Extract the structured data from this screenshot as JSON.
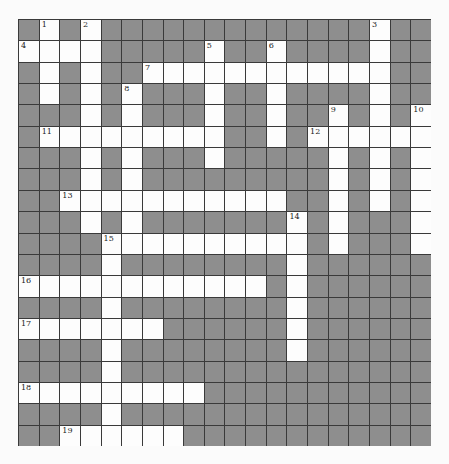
{
  "puzzle": {
    "rows": 20,
    "cols": 20,
    "colors": {
      "block": "#8e8e8e",
      "open": "#fdfdfd",
      "grid_line": "#3a3a3a",
      "number": "#222222"
    },
    "open_cells": [
      [
        0,
        1
      ],
      [
        0,
        3
      ],
      [
        0,
        17
      ],
      [
        1,
        0
      ],
      [
        1,
        1
      ],
      [
        1,
        2
      ],
      [
        1,
        3
      ],
      [
        1,
        9
      ],
      [
        1,
        12
      ],
      [
        1,
        17
      ],
      [
        2,
        1
      ],
      [
        2,
        3
      ],
      [
        2,
        6
      ],
      [
        2,
        7
      ],
      [
        2,
        8
      ],
      [
        2,
        9
      ],
      [
        2,
        10
      ],
      [
        2,
        11
      ],
      [
        2,
        12
      ],
      [
        2,
        13
      ],
      [
        2,
        14
      ],
      [
        2,
        15
      ],
      [
        2,
        16
      ],
      [
        2,
        17
      ],
      [
        3,
        1
      ],
      [
        3,
        3
      ],
      [
        3,
        5
      ],
      [
        3,
        9
      ],
      [
        3,
        12
      ],
      [
        3,
        17
      ],
      [
        4,
        3
      ],
      [
        4,
        5
      ],
      [
        4,
        9
      ],
      [
        4,
        12
      ],
      [
        4,
        15
      ],
      [
        4,
        17
      ],
      [
        4,
        19
      ],
      [
        5,
        1
      ],
      [
        5,
        2
      ],
      [
        5,
        3
      ],
      [
        5,
        4
      ],
      [
        5,
        5
      ],
      [
        5,
        6
      ],
      [
        5,
        7
      ],
      [
        5,
        8
      ],
      [
        5,
        9
      ],
      [
        5,
        12
      ],
      [
        5,
        14
      ],
      [
        5,
        15
      ],
      [
        5,
        16
      ],
      [
        5,
        17
      ],
      [
        5,
        18
      ],
      [
        5,
        19
      ],
      [
        6,
        3
      ],
      [
        6,
        5
      ],
      [
        6,
        9
      ],
      [
        6,
        15
      ],
      [
        6,
        17
      ],
      [
        6,
        19
      ],
      [
        7,
        3
      ],
      [
        7,
        5
      ],
      [
        7,
        15
      ],
      [
        7,
        17
      ],
      [
        7,
        19
      ],
      [
        8,
        2
      ],
      [
        8,
        3
      ],
      [
        8,
        4
      ],
      [
        8,
        5
      ],
      [
        8,
        6
      ],
      [
        8,
        7
      ],
      [
        8,
        8
      ],
      [
        8,
        9
      ],
      [
        8,
        10
      ],
      [
        8,
        11
      ],
      [
        8,
        12
      ],
      [
        8,
        15
      ],
      [
        8,
        17
      ],
      [
        8,
        19
      ],
      [
        9,
        3
      ],
      [
        9,
        5
      ],
      [
        9,
        13
      ],
      [
        9,
        15
      ],
      [
        9,
        19
      ],
      [
        10,
        4
      ],
      [
        10,
        5
      ],
      [
        10,
        6
      ],
      [
        10,
        7
      ],
      [
        10,
        8
      ],
      [
        10,
        9
      ],
      [
        10,
        10
      ],
      [
        10,
        11
      ],
      [
        10,
        12
      ],
      [
        10,
        13
      ],
      [
        10,
        15
      ],
      [
        10,
        19
      ],
      [
        11,
        4
      ],
      [
        11,
        13
      ],
      [
        12,
        0
      ],
      [
        12,
        1
      ],
      [
        12,
        2
      ],
      [
        12,
        3
      ],
      [
        12,
        4
      ],
      [
        12,
        5
      ],
      [
        12,
        6
      ],
      [
        12,
        7
      ],
      [
        12,
        8
      ],
      [
        12,
        9
      ],
      [
        12,
        10
      ],
      [
        12,
        11
      ],
      [
        12,
        13
      ],
      [
        13,
        4
      ],
      [
        13,
        13
      ],
      [
        14,
        0
      ],
      [
        14,
        1
      ],
      [
        14,
        2
      ],
      [
        14,
        3
      ],
      [
        14,
        4
      ],
      [
        14,
        5
      ],
      [
        14,
        6
      ],
      [
        14,
        13
      ],
      [
        15,
        4
      ],
      [
        15,
        13
      ],
      [
        16,
        4
      ],
      [
        17,
        0
      ],
      [
        17,
        1
      ],
      [
        17,
        2
      ],
      [
        17,
        3
      ],
      [
        17,
        4
      ],
      [
        17,
        5
      ],
      [
        17,
        6
      ],
      [
        17,
        7
      ],
      [
        17,
        8
      ],
      [
        18,
        4
      ],
      [
        19,
        2
      ],
      [
        19,
        3
      ],
      [
        19,
        4
      ],
      [
        19,
        5
      ],
      [
        19,
        6
      ],
      [
        19,
        7
      ]
    ],
    "numbers": [
      {
        "n": "1",
        "row": 0,
        "col": 1
      },
      {
        "n": "2",
        "row": 0,
        "col": 3
      },
      {
        "n": "3",
        "row": 0,
        "col": 17
      },
      {
        "n": "4",
        "row": 1,
        "col": 0
      },
      {
        "n": "5",
        "row": 1,
        "col": 9
      },
      {
        "n": "6",
        "row": 1,
        "col": 12
      },
      {
        "n": "7",
        "row": 2,
        "col": 6
      },
      {
        "n": "8",
        "row": 3,
        "col": 5
      },
      {
        "n": "9",
        "row": 4,
        "col": 15
      },
      {
        "n": "10",
        "row": 4,
        "col": 19
      },
      {
        "n": "11",
        "row": 5,
        "col": 1
      },
      {
        "n": "12",
        "row": 5,
        "col": 14
      },
      {
        "n": "13",
        "row": 8,
        "col": 2
      },
      {
        "n": "14",
        "row": 9,
        "col": 13
      },
      {
        "n": "15",
        "row": 10,
        "col": 4
      },
      {
        "n": "16",
        "row": 12,
        "col": 0
      },
      {
        "n": "17",
        "row": 14,
        "col": 0
      },
      {
        "n": "18",
        "row": 17,
        "col": 0
      },
      {
        "n": "19",
        "row": 19,
        "col": 2
      }
    ],
    "entries": {
      "across": [
        {
          "n": "4",
          "row": 1,
          "col": 0,
          "length": 4
        },
        {
          "n": "7",
          "row": 2,
          "col": 6,
          "length": 12
        },
        {
          "n": "11",
          "row": 5,
          "col": 1,
          "length": 9
        },
        {
          "n": "12",
          "row": 5,
          "col": 14,
          "length": 6
        },
        {
          "n": "13",
          "row": 8,
          "col": 2,
          "length": 11
        },
        {
          "n": "15",
          "row": 10,
          "col": 4,
          "length": 10
        },
        {
          "n": "16",
          "row": 12,
          "col": 0,
          "length": 12
        },
        {
          "n": "17",
          "row": 14,
          "col": 0,
          "length": 7
        },
        {
          "n": "18",
          "row": 17,
          "col": 0,
          "length": 9
        },
        {
          "n": "19",
          "row": 19,
          "col": 2,
          "length": 6
        }
      ],
      "down": [
        {
          "n": "1",
          "row": 0,
          "col": 1,
          "length": 4
        },
        {
          "n": "2",
          "row": 0,
          "col": 3,
          "length": 10
        },
        {
          "n": "3",
          "row": 0,
          "col": 17,
          "length": 9
        },
        {
          "n": "5",
          "row": 1,
          "col": 9,
          "length": 6
        },
        {
          "n": "6",
          "row": 1,
          "col": 12,
          "length": 5
        },
        {
          "n": "8",
          "row": 3,
          "col": 5,
          "length": 8
        },
        {
          "n": "9",
          "row": 4,
          "col": 15,
          "length": 7
        },
        {
          "n": "10",
          "row": 4,
          "col": 19,
          "length": 7
        },
        {
          "n": "14",
          "row": 9,
          "col": 13,
          "length": 7
        },
        {
          "n": "15",
          "row": 10,
          "col": 4,
          "length": 10
        }
      ]
    }
  }
}
